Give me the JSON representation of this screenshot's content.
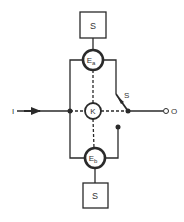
{
  "diagram": {
    "type": "block-schematic",
    "colors": {
      "line": "#2a2a2a",
      "background": "#ffffff",
      "text": "#333333"
    },
    "nodes": {
      "source_top": {
        "label": "S",
        "shape": "square"
      },
      "element_a": {
        "label": "E",
        "subscript": "a",
        "shape": "circle"
      },
      "coupler": {
        "label": "K",
        "shape": "circle"
      },
      "element_b": {
        "label": "E",
        "subscript": "b",
        "shape": "circle"
      },
      "source_bottom": {
        "label": "S",
        "shape": "square"
      },
      "switch": {
        "label": "S"
      },
      "input": {
        "label": "I"
      },
      "output": {
        "label": "O"
      }
    },
    "edges": [
      {
        "from": "source_top",
        "to": "element_a",
        "style": "solid"
      },
      {
        "from": "element_a",
        "to": "coupler",
        "style": "dashed"
      },
      {
        "from": "coupler",
        "to": "element_b",
        "style": "dashed"
      },
      {
        "from": "source_bottom",
        "to": "element_b",
        "style": "solid"
      },
      {
        "from": "input",
        "to": "left-junction",
        "style": "solid-arrow"
      },
      {
        "from": "left-junction",
        "to": "coupler",
        "style": "dashed"
      },
      {
        "from": "coupler",
        "to": "right-junction",
        "style": "dashed"
      },
      {
        "from": "right-junction",
        "to": "output",
        "style": "solid"
      },
      {
        "from": "element_a",
        "to": "left-junction",
        "style": "solid"
      },
      {
        "from": "left-junction",
        "to": "element_b",
        "style": "solid"
      },
      {
        "from": "element_a",
        "to": "switch",
        "style": "solid"
      },
      {
        "from": "switch",
        "to": "right-junction",
        "style": "switch-arm"
      },
      {
        "from": "switch-lower-contact",
        "to": "element_b",
        "style": "solid"
      }
    ]
  }
}
